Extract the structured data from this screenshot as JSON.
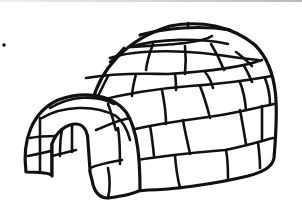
{
  "image": {
    "subject": "igloo",
    "style": "black and white line drawing",
    "description": "Igloo made of snow blocks with a domed body and an arched tunnel entrance on the left",
    "colors": {
      "stroke": "#111111",
      "background": "#ffffff",
      "top_edge": "#c8c8c8"
    },
    "elements": [
      "dome",
      "top-ring",
      "block-rows",
      "tunnel-entrance",
      "doorway",
      "dot"
    ]
  }
}
